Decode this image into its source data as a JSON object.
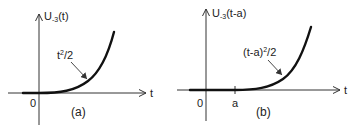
{
  "panels": [
    {
      "id": "a",
      "y_axis_label_main": "U",
      "y_axis_label_sub": "-3",
      "y_axis_label_arg": "(t)",
      "x_axis_label": "t",
      "origin_label": "0",
      "curve_label_base": "t",
      "curve_label_sup": "2",
      "curve_label_rest": "/2",
      "caption": "(a)"
    },
    {
      "id": "b",
      "y_axis_label_main": "U",
      "y_axis_label_sub": "-3",
      "y_axis_label_arg": "(t-a)",
      "x_axis_label": "t",
      "origin_label": "0",
      "tick_label": "a",
      "curve_label_base": "(t-a)",
      "curve_label_sup": "2",
      "curve_label_rest": "/2",
      "caption": "(b)"
    }
  ],
  "colors": {
    "axis": "#333333",
    "curve": "#111111",
    "text": "#222222"
  }
}
